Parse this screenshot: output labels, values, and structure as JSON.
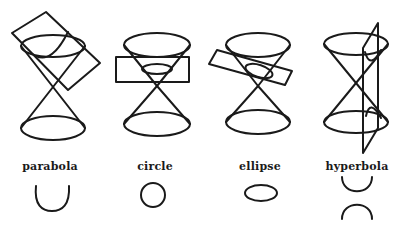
{
  "diagram": {
    "panels": [
      {
        "id": "parabola",
        "label": "parabola",
        "label_x": 50,
        "label_y": 160
      },
      {
        "id": "circle",
        "label": "circle",
        "label_x": 155,
        "label_y": 160
      },
      {
        "id": "ellipse",
        "label": "ellipse",
        "label_x": 260,
        "label_y": 160
      },
      {
        "id": "hyperbola",
        "label": "hyperbola",
        "label_x": 357,
        "label_y": 160
      }
    ],
    "stroke_color": "#1a1a1a",
    "background": "#ffffff"
  }
}
